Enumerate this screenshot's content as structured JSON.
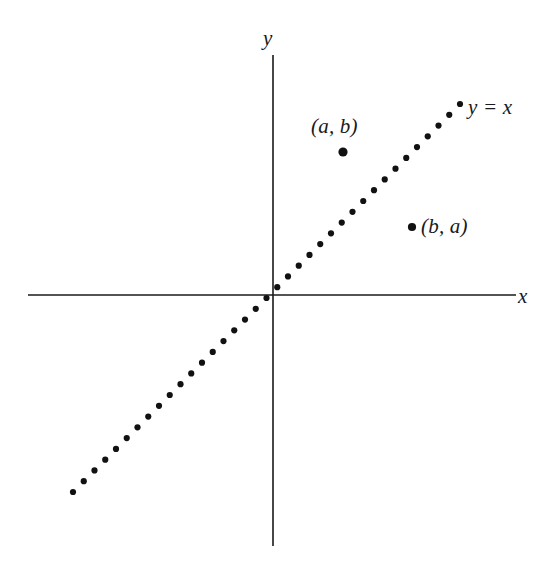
{
  "figure": {
    "kind": "cartesian-diagram",
    "background_color": "#ffffff",
    "ink_color": "#1a1a1a"
  },
  "axes": {
    "x_label": "x",
    "y_label": "y",
    "origin": {
      "x": 273,
      "y": 296
    },
    "x_axis": {
      "x1": 28,
      "y1": 295,
      "x2": 516,
      "y2": 295
    },
    "y_axis": {
      "x1": 273,
      "y1": 55,
      "x2": 273,
      "y2": 546
    }
  },
  "chart_data": {
    "type": "line",
    "title": "",
    "xlabel": "x",
    "ylabel": "y",
    "grid": false,
    "legend": "none",
    "annotations": [
      {
        "text": "y = x",
        "x": 468,
        "y": 97
      },
      {
        "text": "(a, b)",
        "x": 311,
        "y": 116
      },
      {
        "text": "(b, a)",
        "x": 421,
        "y": 216
      }
    ],
    "series": [
      {
        "name": "y = x",
        "style": "dotted",
        "equation": "y = x",
        "slope": 1,
        "intercept": 0,
        "start_px": {
          "x": 73,
          "y": 492
        },
        "end_px": {
          "x": 460,
          "y": 104
        },
        "dot_count": 37,
        "dot_radius_px": 3.1
      }
    ],
    "points": [
      {
        "label": "(a, b)",
        "px": {
          "x": 343,
          "y": 152
        },
        "radius_px": 4.6,
        "label_position": "above"
      },
      {
        "label": "(b, a)",
        "px": {
          "x": 412,
          "y": 227
        },
        "radius_px": 4.1,
        "label_position": "right"
      }
    ]
  },
  "labels": {
    "axis_y": "y",
    "axis_x": "x",
    "line_equation": "y = x",
    "point_ab": "(a, b)",
    "point_ba": "(b, a)"
  }
}
